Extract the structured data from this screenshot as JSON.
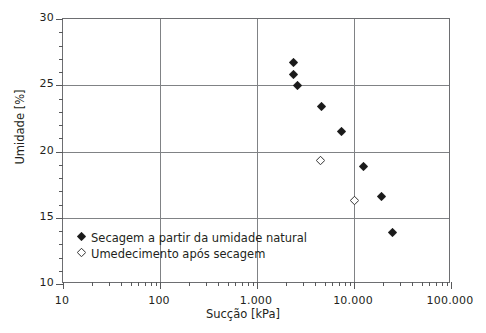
{
  "chart_data": {
    "type": "scatter",
    "title": "",
    "xlabel": "Sucção [kPa]",
    "ylabel": "Umidade [%]",
    "xscale": "log",
    "yscale": "linear",
    "xlim": [
      10,
      100000
    ],
    "ylim": [
      10,
      30
    ],
    "grid": true,
    "legend_position": "inside-bottom-left",
    "x_tick_labels": [
      "10",
      "100",
      "1.000",
      "10.000",
      "100.000"
    ],
    "x_tick_values": [
      10,
      100,
      1000,
      10000,
      100000
    ],
    "y_tick_labels": [
      "10",
      "15",
      "20",
      "25",
      "30"
    ],
    "y_tick_values": [
      10,
      15,
      20,
      25,
      30
    ],
    "y_minor_step": 1,
    "series": [
      {
        "name": "Secagem a partir da umidade natural",
        "marker": "filled-diamond",
        "color": "#1a1a1a",
        "points": [
          {
            "x": 2400,
            "y": 26.7
          },
          {
            "x": 2400,
            "y": 25.8
          },
          {
            "x": 2600,
            "y": 25.0
          },
          {
            "x": 4600,
            "y": 23.4
          },
          {
            "x": 7500,
            "y": 21.5
          },
          {
            "x": 12500,
            "y": 18.9
          },
          {
            "x": 19000,
            "y": 16.6
          },
          {
            "x": 25000,
            "y": 13.9
          }
        ]
      },
      {
        "name": "Umedecimento após secagem",
        "marker": "open-diamond",
        "color": "#1a1a1a",
        "points": [
          {
            "x": 4500,
            "y": 19.3
          },
          {
            "x": 10000,
            "y": 16.3
          }
        ]
      }
    ]
  },
  "legend": {
    "items": [
      {
        "label": "Secagem a partir da umidade natural",
        "marker": "filled-diamond"
      },
      {
        "label": "Umedecimento após secagem",
        "marker": "open-diamond"
      }
    ]
  },
  "axes": {
    "x_title": "Sucção [kPa]",
    "y_title": "Umidade [%]"
  }
}
